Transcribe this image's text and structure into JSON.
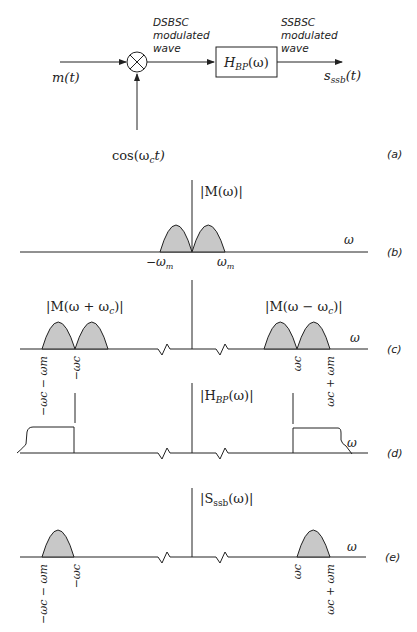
{
  "block_diagram": {
    "input_label": "m(t)",
    "mixer_symbol": "⊗",
    "carrier_label": "cos(ω",
    "carrier_sub": "c",
    "carrier_tail": "t)",
    "dsbsc_label": [
      "DSBSC",
      "modulated",
      "wave"
    ],
    "filter_label": "H",
    "filter_sub": "BP",
    "filter_tail": "(ω)",
    "ssbsc_label": [
      "SSBSC",
      "modulated",
      "wave"
    ],
    "output_label": "s",
    "output_sub": "ssb",
    "output_tail": "(t)",
    "panel_label": "(a)"
  },
  "panel_b": {
    "title": "|M(ω)|",
    "axis_label": "ω",
    "ticks": [
      "−ω",
      "ω"
    ],
    "tick_sub": "m",
    "panel_label": "(b)"
  },
  "panel_c": {
    "left_title": "|M(ω + ω",
    "right_title": "|M(ω − ω",
    "title_sub": "c",
    "title_tail": ")|",
    "axis_label": "ω",
    "ticks": [
      "−ωc − ωm",
      "−ωc",
      "ωc",
      "ωc + ωm"
    ],
    "panel_label": "(c)"
  },
  "panel_d": {
    "title": "|H",
    "title_sub": "BP",
    "title_tail": "(ω)|",
    "axis_label": "ω",
    "panel_label": "(d)"
  },
  "panel_e": {
    "title": "|S",
    "title_sub": "ssb",
    "title_tail": "(ω)|",
    "axis_label": "ω",
    "ticks": [
      "−ωc − ωm",
      "−ωc",
      "ωc",
      "ωc + ωm"
    ],
    "panel_label": "(e)"
  },
  "colors": {
    "line": "#222222",
    "fill": "#c8c8c8"
  }
}
